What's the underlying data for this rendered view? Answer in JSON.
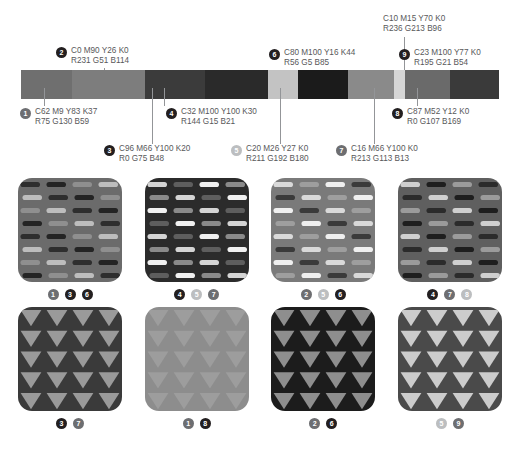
{
  "bar": {
    "segments": [
      {
        "index": 1,
        "tone": "#6f6f6f",
        "width": 62
      },
      {
        "index": 2,
        "tone": "#7d7d7d",
        "width": 88
      },
      {
        "index": 3,
        "tone": "#3b3b3b",
        "width": 73
      },
      {
        "index": 4,
        "tone": "#2a2a2a",
        "width": 76
      },
      {
        "index": 5,
        "tone": "#c3c3c3",
        "width": 36
      },
      {
        "index": 6,
        "tone": "#1b1b1b",
        "width": 60
      },
      {
        "index": 7,
        "tone": "#8a8a8a",
        "width": 56
      },
      {
        "index": 10,
        "tone": "#d6d6d6",
        "width": 13
      },
      {
        "index": 8,
        "tone": "#6a6a6a",
        "width": 55
      },
      {
        "index": 9,
        "tone": "#3a3a3a",
        "width": 59
      }
    ]
  },
  "callouts": [
    {
      "num": "1",
      "style": "mid",
      "cmyk": "C62 M9 Y83 K37",
      "rgb": "R75 G130 B59"
    },
    {
      "num": "2",
      "style": "dark",
      "cmyk": "C0 M90 Y26 K0",
      "rgb": "R231 G51 B114"
    },
    {
      "num": "3",
      "style": "dark",
      "cmyk": "C96 M66 Y100 K20",
      "rgb": "R0 G75 B48"
    },
    {
      "num": "4",
      "style": "dark",
      "cmyk": "C32 M100 Y100 K30",
      "rgb": "R144 G15 B21"
    },
    {
      "num": "5",
      "style": "light",
      "cmyk": "C20 M26 Y27 K0",
      "rgb": "R211 G192 B180"
    },
    {
      "num": "6",
      "style": "dark",
      "cmyk": "C80 M100 Y16 K44",
      "rgb": "R56 G5 B85"
    },
    {
      "num": "7",
      "style": "mid",
      "cmyk": "C16 M66 Y100 K0",
      "rgb": "R213 G113 B13"
    },
    {
      "num": "8",
      "style": "dark",
      "cmyk": "C87 M52 Y12 K0",
      "rgb": "R0 G107 B169"
    },
    {
      "num": "9",
      "style": "dark",
      "cmyk": "C23 M100 Y77 K0",
      "rgb": "R195 G21 B54"
    },
    {
      "num": "",
      "style": "none",
      "cmyk": "C10 M15 Y70 K0",
      "rgb": "R236 G213 B96"
    }
  ],
  "swatches_top": [
    {
      "name": "swatch-dash-1",
      "bg": "#6b6b6b",
      "marks": [
        "#2e2e2e",
        "#bdbdbd",
        "#8f8f8f",
        "#242424"
      ],
      "tags": [
        {
          "num": "1",
          "style": "mid"
        },
        {
          "num": "3",
          "style": "dark"
        },
        {
          "num": "6",
          "style": "dark"
        }
      ]
    },
    {
      "name": "swatch-dash-2",
      "bg": "#2b2b2b",
      "marks": [
        "#d4d4d4",
        "#8a8a8a",
        "#f0f0f0",
        "#5e5e5e"
      ],
      "tags": [
        {
          "num": "4",
          "style": "dark"
        },
        {
          "num": "5",
          "style": "light"
        },
        {
          "num": "7",
          "style": "mid"
        }
      ]
    },
    {
      "name": "swatch-dash-3",
      "bg": "#7a7a7a",
      "marks": [
        "#d9d9d9",
        "#3a3a3a",
        "#efefef",
        "#9e9e9e"
      ],
      "tags": [
        {
          "num": "2",
          "style": "mid"
        },
        {
          "num": "5",
          "style": "light"
        },
        {
          "num": "6",
          "style": "dark"
        }
      ]
    },
    {
      "name": "swatch-dash-4",
      "bg": "#5f5f5f",
      "marks": [
        "#cfcfcf",
        "#2b2b2b",
        "#9b9b9b",
        "#1e1e1e"
      ],
      "tags": [
        {
          "num": "4",
          "style": "dark"
        },
        {
          "num": "7",
          "style": "mid"
        },
        {
          "num": "8",
          "style": "light"
        }
      ]
    }
  ],
  "swatches_bottom": [
    {
      "name": "swatch-triangle-1",
      "bg": "#3a3a3a",
      "mark": "#9a9a9a",
      "tags": [
        {
          "num": "3",
          "style": "dark"
        },
        {
          "num": "7",
          "style": "mid"
        }
      ]
    },
    {
      "name": "swatch-triangle-2",
      "bg": "#8d8d8d",
      "mark": "#9d9d9d",
      "tags": [
        {
          "num": "1",
          "style": "mid"
        },
        {
          "num": "8",
          "style": "dark"
        }
      ]
    },
    {
      "name": "swatch-triangle-3",
      "bg": "#1c1c1c",
      "mark": "#8e8e8e",
      "tags": [
        {
          "num": "2",
          "style": "mid"
        },
        {
          "num": "6",
          "style": "dark"
        }
      ]
    },
    {
      "name": "swatch-triangle-4",
      "bg": "#4a4a4a",
      "mark": "#cccccc",
      "tags": [
        {
          "num": "5",
          "style": "light"
        },
        {
          "num": "9",
          "style": "mid"
        }
      ]
    }
  ]
}
